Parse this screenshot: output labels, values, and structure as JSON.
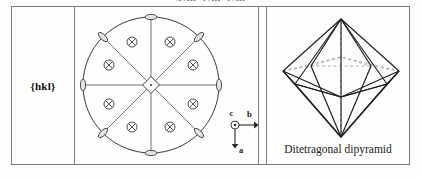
{
  "heading": {
    "text": "4/m 2/m 2/m"
  },
  "table": {
    "row": {
      "form_symbol": "{hkl}",
      "stereogram": {
        "axes": {
          "c_label": "c",
          "b_label": "b",
          "a_label": "a",
          "c_symbol": "circle-dot-out-of-page",
          "b_direction": "right",
          "a_direction": "down"
        },
        "center_symmetry_symbol": "4-fold-rotation-axis-diamond",
        "pole_symbol": "crossed-circle",
        "pole_count": 8,
        "edge_symbol": "2-fold-axis-ellipse",
        "edge_symbol_count": 8,
        "mirror_line_count": 4,
        "primitive_circle": "solid"
      },
      "crystal_form": {
        "caption": "Ditetragonal dipyramid",
        "shape": "ditetragonal-dipyramid"
      }
    }
  },
  "colors": {
    "border": "#7b7b7b",
    "ink": "#1a1a1a",
    "line": "#4d4d4d",
    "hidden_line": "#9a9a9a",
    "background": "#fdfdfd"
  }
}
